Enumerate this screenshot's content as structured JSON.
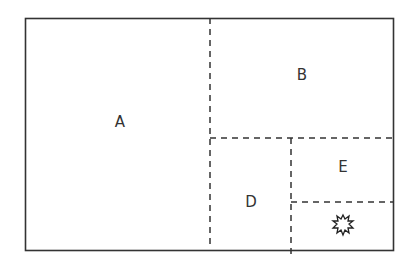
{
  "diagram": {
    "regions": [
      {
        "id": "A",
        "label": "A",
        "x": 120,
        "y": 122
      },
      {
        "id": "B",
        "label": "B",
        "x": 302,
        "y": 75
      },
      {
        "id": "D",
        "label": "D",
        "x": 251,
        "y": 202
      },
      {
        "id": "E",
        "label": "E",
        "x": 343,
        "y": 167
      }
    ],
    "star_symbol": {
      "x": 343,
      "y": 226
    },
    "colors": {
      "line": "#333333"
    }
  }
}
